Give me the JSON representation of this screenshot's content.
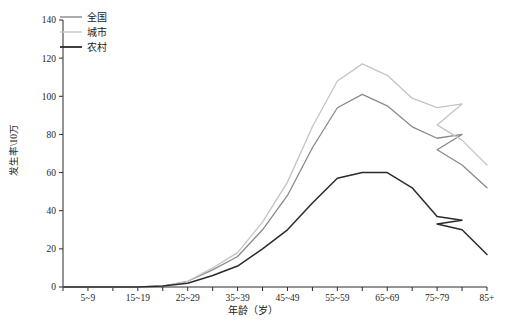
{
  "chart_data": {
    "type": "line",
    "title": "",
    "xlabel": "年龄（岁）",
    "ylabel": "发生率\\10万",
    "ylim": [
      0,
      140
    ],
    "yticks": [
      0,
      20,
      40,
      60,
      80,
      100,
      120,
      140
    ],
    "ytick_labels": [
      "0",
      "20",
      "40",
      "60",
      "80",
      "100",
      "120",
      "140"
    ],
    "grid": false,
    "legend_position": "top-left",
    "categories": [
      "0~4",
      "5~9",
      "10~14",
      "15~19",
      "20~24",
      "25~29",
      "30~34",
      "35~39",
      "40~44",
      "45~49",
      "50~54",
      "55~59",
      "60~64",
      "65~69",
      "70~74",
      "75~79",
      "80~84",
      "85+"
    ],
    "xtick_labels": [
      "",
      "5~9",
      "",
      "15~19",
      "",
      "25~29",
      "",
      "35~39",
      "",
      "45~49",
      "",
      "55~59",
      "",
      "65~69",
      "",
      "75~79",
      "",
      "85+"
    ],
    "series": [
      {
        "name": "全国",
        "color": "#8a8a8a",
        "values": [
          0,
          0,
          0,
          0,
          0.5,
          3,
          9,
          16,
          30,
          48,
          73,
          94,
          101,
          95,
          84,
          78,
          80,
          72
        ]
      },
      {
        "name": "城市",
        "color": "#c4c4c4",
        "values": [
          0,
          0,
          0,
          0,
          0.5,
          3,
          10,
          18,
          34,
          55,
          84,
          108,
          117,
          111,
          99,
          94,
          96,
          85
        ]
      },
      {
        "name": "农村",
        "color": "#2b2b2b",
        "values": [
          0,
          0,
          0,
          0,
          0.5,
          2,
          6,
          11,
          20,
          30,
          44,
          57,
          60,
          60,
          52,
          37,
          35,
          33
        ]
      }
    ],
    "series_tail": {
      "全国": [
        72,
        64,
        52
      ],
      "城市": [
        85,
        77,
        64
      ],
      "农村": [
        33,
        30,
        17
      ]
    },
    "legend_entries": [
      {
        "label": "全国",
        "color": "#8a8a8a"
      },
      {
        "label": "城市",
        "color": "#c4c4c4"
      },
      {
        "label": "农村",
        "color": "#2b2b2b"
      }
    ]
  },
  "axes": {
    "y_axis_label": "发生率\\10万",
    "x_axis_label": "年龄（岁）"
  }
}
